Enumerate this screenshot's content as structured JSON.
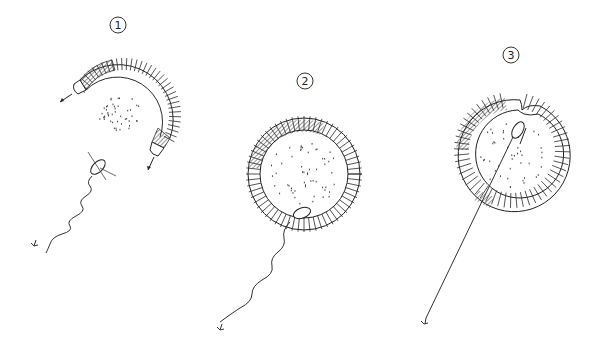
{
  "diagram": {
    "type": "purse-seine-stages",
    "colors": {
      "ink": "#2a2a2a",
      "background": "#ffffff"
    },
    "stages": [
      {
        "label": "1",
        "description": "Seine being set in an arc around fish school; skiff and two boats"
      },
      {
        "label": "2",
        "description": "Net closed into a full circle; boat attached; line to anchor"
      },
      {
        "label": "3",
        "description": "Net pursed with inward loop; boat inside; straight line to anchor"
      }
    ]
  }
}
